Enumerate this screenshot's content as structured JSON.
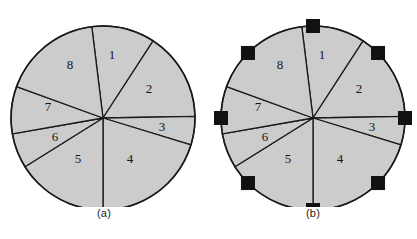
{
  "figure": {
    "background_color": "#ffffff",
    "sector_fill_color": "#cccccc",
    "outline_color": "#1a1a1a",
    "node_marker_color": "#111111",
    "panels": [
      {
        "id": "a",
        "caption": "(a)",
        "center_x": 103,
        "center_y": 118,
        "radius": 92,
        "has_boundary_nodes": false,
        "sector_labels": [
          "1",
          "2",
          "3",
          "4",
          "5",
          "6",
          "7",
          "8"
        ],
        "sectors": [
          {
            "label": "1",
            "start_angle_deg": -97,
            "end_angle_deg": -57,
            "label_x": 112,
            "label_y": 56
          },
          {
            "label": "2",
            "start_angle_deg": -57,
            "end_angle_deg": -1,
            "label_x": 149,
            "label_y": 90
          },
          {
            "label": "3",
            "start_angle_deg": -1,
            "end_angle_deg": 17,
            "label_x": 162,
            "label_y": 128
          },
          {
            "label": "4",
            "start_angle_deg": 17,
            "end_angle_deg": 90,
            "label_x": 130,
            "label_y": 160
          },
          {
            "label": "5",
            "start_angle_deg": 90,
            "end_angle_deg": 148,
            "label_x": 78,
            "label_y": 160
          },
          {
            "label": "6",
            "start_angle_deg": 148,
            "end_angle_deg": 170,
            "label_x": 55,
            "label_y": 138
          },
          {
            "label": "7",
            "start_angle_deg": 170,
            "end_angle_deg": 200,
            "label_x": 48,
            "label_y": 108
          },
          {
            "label": "8",
            "start_angle_deg": 200,
            "end_angle_deg": 263,
            "label_x": 70,
            "label_y": 66
          }
        ]
      },
      {
        "id": "b",
        "caption": "(b)",
        "center_x": 104,
        "center_y": 118,
        "radius": 92,
        "has_boundary_nodes": true,
        "node_count": 8,
        "node_size": 13,
        "node_angles_deg": [
          -90,
          -45,
          0,
          45,
          90,
          135,
          180,
          225
        ],
        "sector_labels": [
          "1",
          "2",
          "3",
          "4",
          "5",
          "6",
          "7",
          "8"
        ],
        "sectors": [
          {
            "label": "1",
            "start_angle_deg": -97,
            "end_angle_deg": -57,
            "label_x": 113,
            "label_y": 56
          },
          {
            "label": "2",
            "start_angle_deg": -57,
            "end_angle_deg": -1,
            "label_x": 150,
            "label_y": 90
          },
          {
            "label": "3",
            "start_angle_deg": -1,
            "end_angle_deg": 17,
            "label_x": 163,
            "label_y": 128
          },
          {
            "label": "4",
            "start_angle_deg": 17,
            "end_angle_deg": 90,
            "label_x": 131,
            "label_y": 160
          },
          {
            "label": "5",
            "start_angle_deg": 90,
            "end_angle_deg": 148,
            "label_x": 79,
            "label_y": 160
          },
          {
            "label": "6",
            "start_angle_deg": 148,
            "end_angle_deg": 170,
            "label_x": 56,
            "label_y": 138
          },
          {
            "label": "7",
            "start_angle_deg": 170,
            "end_angle_deg": 200,
            "label_x": 49,
            "label_y": 108
          },
          {
            "label": "8",
            "start_angle_deg": 200,
            "end_angle_deg": 263,
            "label_x": 71,
            "label_y": 66
          }
        ]
      }
    ]
  }
}
